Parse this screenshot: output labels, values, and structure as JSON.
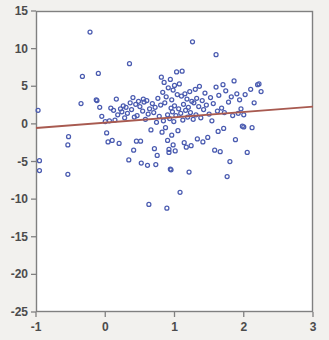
{
  "chart_data": {
    "type": "scatter",
    "title": "",
    "subtitle": "",
    "xlabel": "",
    "ylabel": "",
    "xlim": [
      -1,
      3
    ],
    "ylim": [
      -25,
      15
    ],
    "xticks": [
      -1,
      0,
      1,
      2,
      3
    ],
    "yticks": [
      15,
      10,
      5,
      0,
      -5,
      -10,
      -15,
      -20,
      -25
    ],
    "xtick_labels": [
      "-1",
      "0",
      "1",
      "2",
      "3"
    ],
    "ytick_labels": [
      "15",
      "10",
      "5",
      "0",
      "-5",
      "-10",
      "-15",
      "-20",
      "-25"
    ],
    "grid": false,
    "legend": null,
    "annotations": [],
    "marker": {
      "shape": "circle-open",
      "color": "#4a5bb0",
      "size": 4
    },
    "series": [
      {
        "name": "observations",
        "type": "scatter",
        "points": [
          [
            -0.97,
            1.8
          ],
          [
            -0.95,
            -4.9
          ],
          [
            -0.95,
            -6.2
          ],
          [
            -0.53,
            -1.7
          ],
          [
            -0.54,
            -2.8
          ],
          [
            -0.54,
            -6.7
          ],
          [
            -0.35,
            2.7
          ],
          [
            -0.33,
            6.3
          ],
          [
            -0.22,
            12.2
          ],
          [
            -0.13,
            3.2
          ],
          [
            -0.12,
            3.1
          ],
          [
            -0.1,
            6.7
          ],
          [
            -0.08,
            2.2
          ],
          [
            -0.05,
            1.0
          ],
          [
            0.0,
            0.3
          ],
          [
            0.02,
            -1.2
          ],
          [
            0.04,
            -2.4
          ],
          [
            0.06,
            0.4
          ],
          [
            0.08,
            2.1
          ],
          [
            0.1,
            -2.2
          ],
          [
            0.12,
            1.8
          ],
          [
            0.14,
            0.5
          ],
          [
            0.16,
            3.3
          ],
          [
            0.18,
            1.2
          ],
          [
            0.2,
            -2.6
          ],
          [
            0.22,
            2.0
          ],
          [
            0.24,
            1.6
          ],
          [
            0.26,
            2.4
          ],
          [
            0.28,
            0.8
          ],
          [
            0.3,
            2.2
          ],
          [
            0.32,
            1.4
          ],
          [
            0.34,
            -4.8
          ],
          [
            0.35,
            8.0
          ],
          [
            0.36,
            2.8
          ],
          [
            0.38,
            1.9
          ],
          [
            0.4,
            3.5
          ],
          [
            0.41,
            -3.5
          ],
          [
            0.42,
            0.9
          ],
          [
            0.44,
            2.6
          ],
          [
            0.45,
            -2.3
          ],
          [
            0.46,
            1.1
          ],
          [
            0.48,
            3.0
          ],
          [
            0.5,
            2.3
          ],
          [
            0.51,
            -2.3
          ],
          [
            0.52,
            -5.2
          ],
          [
            0.54,
            1.7
          ],
          [
            0.55,
            3.3
          ],
          [
            0.56,
            2.9
          ],
          [
            0.58,
            0.6
          ],
          [
            0.6,
            3.1
          ],
          [
            0.61,
            -5.5
          ],
          [
            0.62,
            1.3
          ],
          [
            0.63,
            -10.7
          ],
          [
            0.64,
            2.0
          ],
          [
            0.66,
            -0.8
          ],
          [
            0.68,
            2.7
          ],
          [
            0.7,
            1.5
          ],
          [
            0.71,
            -3.3
          ],
          [
            0.72,
            2.2
          ],
          [
            0.73,
            -5.4
          ],
          [
            0.74,
            0.2
          ],
          [
            0.75,
            -4.2
          ],
          [
            0.76,
            3.4
          ],
          [
            0.78,
            1.0
          ],
          [
            0.8,
            2.5
          ],
          [
            0.81,
            6.2
          ],
          [
            0.82,
            -1.1
          ],
          [
            0.83,
            4.2
          ],
          [
            0.84,
            0.4
          ],
          [
            0.85,
            5.5
          ],
          [
            0.86,
            2.8
          ],
          [
            0.87,
            -0.5
          ],
          [
            0.88,
            3.6
          ],
          [
            0.89,
            -11.2
          ],
          [
            0.9,
            1.2
          ],
          [
            0.9,
            -2.2
          ],
          [
            0.91,
            4.8
          ],
          [
            0.92,
            -3.4
          ],
          [
            0.92,
            -3.8
          ],
          [
            0.93,
            0.7
          ],
          [
            0.94,
            5.9
          ],
          [
            0.94,
            -6.0
          ],
          [
            0.95,
            2.1
          ],
          [
            0.95,
            -6.1
          ],
          [
            0.96,
            3.2
          ],
          [
            0.96,
            -1.5
          ],
          [
            0.97,
            1.6
          ],
          [
            0.98,
            4.5
          ],
          [
            0.98,
            -2.8
          ],
          [
            0.99,
            0.3
          ],
          [
            1.0,
            2.4
          ],
          [
            1.0,
            5.1
          ],
          [
            1.01,
            -3.6
          ],
          [
            1.02,
            1.1
          ],
          [
            1.03,
            6.9
          ],
          [
            1.04,
            3.9
          ],
          [
            1.05,
            -0.9
          ],
          [
            1.06,
            2.0
          ],
          [
            1.07,
            5.3
          ],
          [
            1.08,
            -9.1
          ],
          [
            1.09,
            1.4
          ],
          [
            1.1,
            3.7
          ],
          [
            1.11,
            7.0
          ],
          [
            1.12,
            0.5
          ],
          [
            1.13,
            2.6
          ],
          [
            1.14,
            -2.5
          ],
          [
            1.15,
            4.0
          ],
          [
            1.16,
            1.8
          ],
          [
            1.17,
            -3.1
          ],
          [
            1.18,
            3.3
          ],
          [
            1.19,
            0.9
          ],
          [
            1.2,
            2.2
          ],
          [
            1.21,
            -6.4
          ],
          [
            1.22,
            4.3
          ],
          [
            1.23,
            1.5
          ],
          [
            1.24,
            -2.9
          ],
          [
            1.25,
            3.0
          ],
          [
            1.26,
            10.9
          ],
          [
            1.27,
            0.6
          ],
          [
            1.28,
            2.8
          ],
          [
            1.3,
            4.6
          ],
          [
            1.31,
            1.2
          ],
          [
            1.32,
            3.4
          ],
          [
            1.33,
            -2.0
          ],
          [
            1.35,
            2.3
          ],
          [
            1.36,
            5.0
          ],
          [
            1.38,
            0.8
          ],
          [
            1.4,
            3.1
          ],
          [
            1.41,
            -2.4
          ],
          [
            1.42,
            1.9
          ],
          [
            1.44,
            4.1
          ],
          [
            1.46,
            2.5
          ],
          [
            1.48,
            -1.8
          ],
          [
            1.5,
            1.3
          ],
          [
            1.52,
            3.5
          ],
          [
            1.54,
            0.4
          ],
          [
            1.56,
            2.7
          ],
          [
            1.58,
            -3.5
          ],
          [
            1.6,
            9.2
          ],
          [
            1.6,
            4.9
          ],
          [
            1.62,
            1.7
          ],
          [
            1.63,
            -1.0
          ],
          [
            1.64,
            3.8
          ],
          [
            1.66,
            -3.7
          ],
          [
            1.68,
            2.1
          ],
          [
            1.7,
            5.2
          ],
          [
            1.71,
            -0.6
          ],
          [
            1.72,
            1.5
          ],
          [
            1.74,
            4.4
          ],
          [
            1.76,
            -7.0
          ],
          [
            1.78,
            2.9
          ],
          [
            1.8,
            -5.0
          ],
          [
            1.82,
            3.6
          ],
          [
            1.84,
            1.1
          ],
          [
            1.86,
            5.7
          ],
          [
            1.88,
            -2.1
          ],
          [
            1.9,
            4.0
          ],
          [
            1.92,
            1.4
          ],
          [
            1.94,
            3.2
          ],
          [
            1.96,
            2.0
          ],
          [
            1.98,
            -0.3
          ],
          [
            2.0,
            1.2
          ],
          [
            2.0,
            -0.4
          ],
          [
            2.02,
            3.9
          ],
          [
            2.05,
            -3.8
          ],
          [
            2.1,
            4.6
          ],
          [
            2.12,
            -0.5
          ],
          [
            2.15,
            2.8
          ],
          [
            2.2,
            5.2
          ],
          [
            2.22,
            5.3
          ],
          [
            2.25,
            4.3
          ]
        ]
      }
    ],
    "fit_line": {
      "name": "linear-fit",
      "color": "#a85a50",
      "x_start": -1,
      "y_start": -0.55,
      "x_end": 3,
      "y_end": 2.3,
      "slope": 0.7125,
      "intercept": 0.1625
    }
  },
  "axes": {
    "frame_color": "#808080",
    "plot_background": "#ffffff",
    "page_background": "#f2f1ee",
    "tick_color": "#808080",
    "label_color": "#4c4c4c"
  }
}
